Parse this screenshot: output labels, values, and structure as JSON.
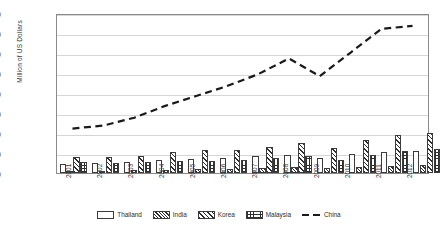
{
  "chart_data": {
    "type": "bar",
    "title": "",
    "xlabel": "",
    "ylabel": "Million of US Dollars",
    "categories": [
      "2001",
      "2002",
      "2003",
      "2004",
      "2005",
      "2006",
      "2007",
      "2008",
      "2009",
      "2010",
      "2011",
      "2012"
    ],
    "ylim": [
      0,
      160000
    ],
    "ytick_step": 20000,
    "yticks": [
      "0",
      "20,000",
      "40,000",
      "60,000",
      "80,000",
      "100,000",
      "120,000",
      "140,000",
      "160,000"
    ],
    "grid": true,
    "legend_position": "bottom",
    "series": [
      {
        "name": "Thailand",
        "type": "bar",
        "fill": "solid-white",
        "values": [
          9500,
          9800,
          11000,
          12800,
          14000,
          15500,
          17000,
          18500,
          15000,
          19500,
          21000,
          22500
        ]
      },
      {
        "name": "India",
        "type": "bar",
        "fill": "dense-diagonal-hatch",
        "values": [
          2200,
          2400,
          2800,
          3400,
          3900,
          4500,
          5200,
          6000,
          5000,
          6500,
          7200,
          7800
        ]
      },
      {
        "name": "Korea",
        "type": "bar",
        "fill": "diagonal-hatch",
        "values": [
          16500,
          16000,
          17000,
          21000,
          22800,
          23500,
          26000,
          30000,
          25500,
          33000,
          38000,
          40000
        ]
      },
      {
        "name": "Malaysia",
        "type": "bar",
        "fill": "cross-hatch",
        "values": [
          11500,
          10000,
          11200,
          12000,
          12500,
          13500,
          15000,
          17000,
          13500,
          18000,
          22000,
          24500
        ]
      },
      {
        "name": "China",
        "type": "line",
        "style": "dashed",
        "values": [
          45000,
          48000,
          56000,
          68000,
          78000,
          88000,
          100000,
          116000,
          98000,
          122000,
          146000,
          149000
        ]
      }
    ]
  },
  "legend": {
    "items": [
      {
        "label": "Thailand"
      },
      {
        "label": "India"
      },
      {
        "label": "Korea"
      },
      {
        "label": "Malaysia"
      },
      {
        "label": "China"
      }
    ]
  }
}
